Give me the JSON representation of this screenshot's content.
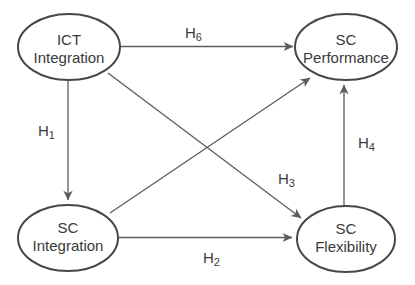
{
  "diagram": {
    "type": "path-model",
    "colors": {
      "line": "#5c5c5c",
      "node_stroke": "#474747",
      "node_fill": "#ffffff",
      "text": "#3a3a3a",
      "background": "#ffffff"
    },
    "nodes": [
      {
        "id": "ict-integration",
        "lines": [
          "ICT",
          "Integration"
        ]
      },
      {
        "id": "sc-performance",
        "lines": [
          "SC",
          "Performance"
        ]
      },
      {
        "id": "sc-integration",
        "lines": [
          "SC",
          "Integration"
        ]
      },
      {
        "id": "sc-flexibility",
        "lines": [
          "SC",
          "Flexibility"
        ]
      }
    ],
    "hypotheses": [
      {
        "base": "H",
        "sub": "1",
        "from": "ICT Integration",
        "to": "SC Integration"
      },
      {
        "base": "H",
        "sub": "2",
        "from": "SC Integration",
        "to": "SC Flexibility"
      },
      {
        "base": "H",
        "sub": "3",
        "from": "ICT Integration",
        "to": "SC Flexibility"
      },
      {
        "base": "H",
        "sub": "4",
        "from": "SC Flexibility",
        "to": "SC Performance"
      },
      {
        "base": "H",
        "sub": "6",
        "from": "ICT Integration",
        "to": "SC Performance"
      }
    ],
    "unlabeled_arrow": {
      "from": "SC Integration",
      "to": "SC Performance"
    }
  }
}
